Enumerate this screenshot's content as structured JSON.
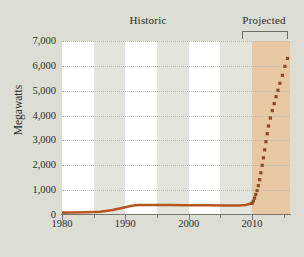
{
  "chart_data": {
    "type": "line",
    "title": "",
    "subtitle": "",
    "xlabel": "",
    "ylabel": "Megawatts",
    "xlim": [
      1980,
      2016
    ],
    "ylim": [
      0,
      7000
    ],
    "grid": true,
    "legend_position": "none",
    "annotations": [
      {
        "text": "Historic",
        "x": 1998,
        "type": "era-label"
      },
      {
        "text": "Projected",
        "x": 2012.5,
        "type": "era-label"
      },
      {
        "text": "",
        "x": 2010,
        "type": "bracket",
        "span": [
          2010,
          2016
        ]
      }
    ],
    "y_ticks": [
      {
        "value": 7000,
        "label": "7,000"
      },
      {
        "value": 6000,
        "label": "6,000"
      },
      {
        "value": 5000,
        "label": "5,000"
      },
      {
        "value": 4000,
        "label": "4,000"
      },
      {
        "value": 3000,
        "label": "3,000"
      },
      {
        "value": 2000,
        "label": "2,000"
      },
      {
        "value": 1000,
        "label": "1,000"
      },
      {
        "value": 0,
        "label": "0"
      }
    ],
    "x_ticks": [
      {
        "value": 1980,
        "label": "1980",
        "major": true
      },
      {
        "value": 1985,
        "label": "",
        "major": false
      },
      {
        "value": 1990,
        "label": "1990",
        "major": true
      },
      {
        "value": 1995,
        "label": "",
        "major": false
      },
      {
        "value": 2000,
        "label": "2000",
        "major": true
      },
      {
        "value": 2005,
        "label": "",
        "major": false
      },
      {
        "value": 2010,
        "label": "2010",
        "major": true
      },
      {
        "value": 2015,
        "label": "",
        "major": false
      }
    ],
    "shaded_regions": [
      {
        "name": "projected-region",
        "x0": 2010,
        "x1": 2016,
        "color": "#e8c8a2"
      },
      {
        "name": "band-1985-1990",
        "x0": 1985,
        "x1": 1990,
        "color": "#e3e5dc"
      },
      {
        "name": "band-1995-2000",
        "x0": 1995,
        "x1": 2000,
        "color": "#e3e5dc"
      },
      {
        "name": "band-2005-2010",
        "x0": 2005,
        "x1": 2010,
        "color": "#e3e5dc"
      }
    ],
    "series": [
      {
        "name": "Historic",
        "style": "solid",
        "color": "#b5561f",
        "x": [
          1980,
          1982,
          1984,
          1986,
          1988,
          1990,
          1991,
          1992,
          1993,
          1995,
          1997,
          2000,
          2003,
          2006,
          2008,
          2009,
          2010
        ],
        "values": [
          95,
          100,
          110,
          130,
          200,
          310,
          370,
          400,
          405,
          400,
          400,
          395,
          390,
          385,
          385,
          400,
          470
        ]
      },
      {
        "name": "Projected",
        "style": "dotted",
        "color": "#8a4a28",
        "x": [
          2010,
          2010.2,
          2010.4,
          2010.6,
          2010.8,
          2011,
          2011.2,
          2011.4,
          2011.6,
          2011.8,
          2012,
          2012.2,
          2012.4,
          2012.6,
          2012.9,
          2013.2,
          2013.5,
          2013.8,
          2014.1,
          2014.4,
          2014.8,
          2015.2,
          2015.6
        ],
        "values": [
          470,
          560,
          680,
          820,
          980,
          1180,
          1420,
          1700,
          2000,
          2300,
          2620,
          2950,
          3270,
          3580,
          3900,
          4200,
          4480,
          4760,
          5020,
          5300,
          5620,
          5980,
          6300
        ]
      }
    ]
  },
  "colors": {
    "background": "#dcded4",
    "plot_background": "#ffffff",
    "band": "#e3e5dc",
    "projected_shade": "#e8c8a2",
    "historic_line": "#b5561f",
    "projected_line": "#8a4a28",
    "axis": "#77776f",
    "grid": "#b9bbb0",
    "text": "#2b2b28"
  }
}
